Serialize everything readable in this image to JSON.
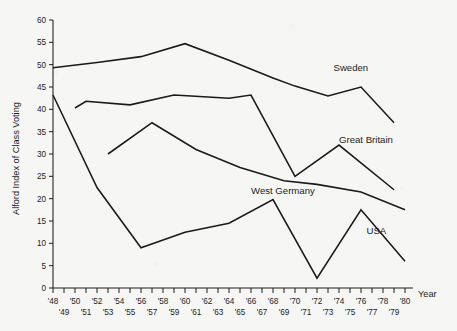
{
  "chart_data": {
    "type": "line",
    "title": "",
    "xlabel": "Year",
    "ylabel": "Alford Index of Class Voting",
    "xlim": [
      1948,
      1980
    ],
    "ylim": [
      0,
      60
    ],
    "ytick_step": 5,
    "yticks": [
      0,
      5,
      10,
      15,
      20,
      25,
      30,
      35,
      40,
      45,
      50,
      55,
      60
    ],
    "ytick_labels": [
      "0",
      "5",
      "10",
      "15",
      "20",
      "25",
      "30",
      "35",
      "40",
      "45",
      "50",
      "55",
      "60"
    ],
    "xticks": [
      1948,
      1949,
      1950,
      1951,
      1952,
      1953,
      1954,
      1955,
      1956,
      1957,
      1958,
      1959,
      1960,
      1961,
      1962,
      1963,
      1964,
      1965,
      1966,
      1967,
      1968,
      1969,
      1970,
      1971,
      1972,
      1973,
      1974,
      1975,
      1976,
      1977,
      1978,
      1979,
      1980
    ],
    "xtick_labels_upper": [
      "'48",
      "'50",
      "'52",
      "'54",
      "'56",
      "'58",
      "'60",
      "'62",
      "'64",
      "'66",
      "'68",
      "'70",
      "'72",
      "'74",
      "'76",
      "'78",
      "'80"
    ],
    "xtick_labels_lower": [
      "'49",
      "'51",
      "'53",
      "'55",
      "'57",
      "'59",
      "'61",
      "'63",
      "'65",
      "'67",
      "'69",
      "'71",
      "'73",
      "'75",
      "'77",
      "'79"
    ],
    "grid": false,
    "legend_position": "inline-end-of-line",
    "line_color": "#1a1a1a",
    "background_color": "#f6f6f4",
    "series": [
      {
        "name": "Sweden",
        "label": "Sweden",
        "x": [
          1948,
          1952,
          1956,
          1960,
          1964,
          1968,
          1970,
          1973,
          1976,
          1979
        ],
        "y": [
          49.3,
          50.5,
          51.8,
          54.7,
          51.0,
          47.0,
          45.2,
          43.0,
          45.0,
          37.0
        ]
      },
      {
        "name": "Great Britain",
        "label": "Great Britain",
        "x": [
          1950,
          1951,
          1955,
          1959,
          1964,
          1966,
          1970,
          1974,
          1979
        ],
        "y": [
          40.3,
          41.8,
          41.0,
          43.2,
          42.5,
          43.2,
          25.0,
          32.0,
          22.0
        ]
      },
      {
        "name": "West Germany",
        "label": "West Germany",
        "x": [
          1953,
          1957,
          1961,
          1965,
          1969,
          1972,
          1976,
          1980
        ],
        "y": [
          30.0,
          37.0,
          31.0,
          27.0,
          24.0,
          23.2,
          21.5,
          17.5
        ]
      },
      {
        "name": "USA",
        "label": "USA",
        "x": [
          1948,
          1952,
          1956,
          1960,
          1964,
          1968,
          1972,
          1976,
          1980
        ],
        "y": [
          43.2,
          22.5,
          9.0,
          12.5,
          14.5,
          19.8,
          2.2,
          17.5,
          6.0
        ]
      }
    ],
    "annotations": [
      {
        "text": "Sweden",
        "x": 1973.5,
        "y": 48.5
      },
      {
        "text": "Great Britain",
        "x": 1974.0,
        "y": 32.5
      },
      {
        "text": "West Germany",
        "x": 1966.0,
        "y": 21.0
      },
      {
        "text": "USA",
        "x": 1976.5,
        "y": 12.0
      }
    ]
  }
}
